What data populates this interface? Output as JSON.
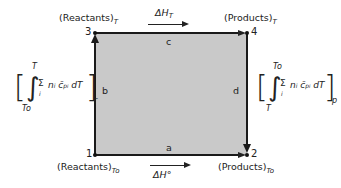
{
  "diagram": {
    "type": "thermodynamic-cycle",
    "fill_color": "#c9c9c9",
    "line_color": "#1a1a1a",
    "nodes": [
      {
        "id": "1",
        "label": "1",
        "state": "(Reactants)",
        "subscript": "To"
      },
      {
        "id": "2",
        "label": "2",
        "state": "(Products)",
        "subscript": "To"
      },
      {
        "id": "3",
        "label": "3",
        "state": "(Reactants)",
        "subscript": "T"
      },
      {
        "id": "4",
        "label": "4",
        "state": "(Products)",
        "subscript": "T"
      }
    ],
    "edges": [
      {
        "id": "a",
        "label": "a",
        "from": "1",
        "to": "2"
      },
      {
        "id": "b",
        "label": "b",
        "from": "1",
        "to": "3"
      },
      {
        "id": "c",
        "label": "c",
        "from": "3",
        "to": "4"
      },
      {
        "id": "d",
        "label": "d",
        "from": "4",
        "to": "2"
      }
    ],
    "top_arrow": {
      "symbol": "ΔH",
      "subscript": "T"
    },
    "bottom_arrow": {
      "symbol": "ΔH°"
    },
    "left_expr": {
      "upper_limit": "T",
      "lower_limit": "To",
      "sum": "Σ",
      "sum_index": "i",
      "body": "n",
      "body_sub": "i",
      "cp": "c̄",
      "cp_sub": "p",
      "cp_sub2": "i",
      "dT": "dT",
      "outer_sub": "r"
    },
    "right_expr": {
      "upper_limit": "To",
      "lower_limit": "T",
      "sum": "Σ",
      "sum_index": "i",
      "body": "n",
      "body_sub": "i",
      "cp": "c̄",
      "cp_sub": "p",
      "cp_sub2": "i",
      "dT": "dT",
      "outer_sub": "p"
    }
  }
}
